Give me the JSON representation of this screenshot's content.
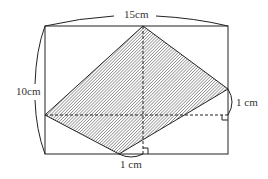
{
  "diagram": {
    "labels": {
      "width": "15cm",
      "height": "10cm",
      "right_offset": "1 cm",
      "bottom_offset": "1 cm"
    },
    "colors": {
      "stroke": "#222222",
      "hatch": "#555555",
      "background": "#ffffff"
    }
  }
}
